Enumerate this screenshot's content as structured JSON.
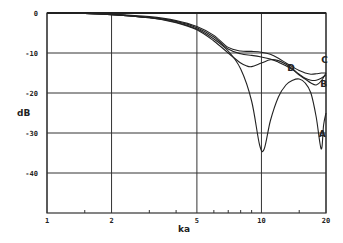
{
  "chart_data": {
    "type": "line",
    "title": "",
    "xlabel": "ka",
    "ylabel": "dB",
    "xscale": "log",
    "xlim": [
      1,
      20
    ],
    "ylim": [
      -50,
      0
    ],
    "grid": true,
    "x_ticks": [
      "1",
      "2",
      "5",
      "10",
      "20"
    ],
    "y_ticks": [
      "0",
      "-10",
      "-20",
      "-30",
      "-40"
    ],
    "series": [
      {
        "name": "A",
        "x": [
          1,
          1.5,
          2,
          3,
          4,
          5,
          6,
          7,
          8,
          9,
          9.8,
          10.3,
          11,
          12,
          13,
          14,
          15,
          16,
          17,
          18,
          19,
          19.5,
          20
        ],
        "values": [
          0,
          -0.1,
          -0.4,
          -1.2,
          -2.3,
          -4,
          -6.5,
          -9.5,
          -14,
          -22,
          -33,
          -34,
          -27,
          -21,
          -18,
          -16.8,
          -16.5,
          -17.5,
          -20,
          -26,
          -34,
          -28,
          -25
        ]
      },
      {
        "name": "B",
        "x": [
          1,
          1.5,
          2,
          3,
          4,
          5,
          6,
          7,
          8,
          9,
          10,
          11,
          12,
          13,
          14,
          15,
          16,
          17,
          18,
          19,
          20
        ],
        "values": [
          0,
          -0.1,
          -0.4,
          -1.1,
          -2.1,
          -3.7,
          -6,
          -9,
          -10.2,
          -10.6,
          -11,
          -11.5,
          -12.3,
          -13.2,
          -14.2,
          -15.5,
          -16.5,
          -17.5,
          -18,
          -17,
          -15
        ]
      },
      {
        "name": "C",
        "x": [
          1,
          1.5,
          2,
          3,
          4,
          5,
          6,
          7,
          8,
          9,
          10,
          11,
          12,
          13,
          14,
          15,
          16,
          17,
          18,
          19,
          20
        ],
        "values": [
          0,
          -0.1,
          -0.3,
          -0.9,
          -1.9,
          -3.4,
          -5.6,
          -8.6,
          -9.5,
          -9.6,
          -9.8,
          -10.3,
          -11.3,
          -12.5,
          -13.5,
          -14.4,
          -15,
          -15.3,
          -15.2,
          -15,
          -15
        ]
      },
      {
        "name": "D",
        "x": [
          1,
          1.5,
          2,
          3,
          4,
          5,
          6,
          7,
          8,
          8.5,
          9,
          10,
          11,
          12,
          13,
          14,
          15,
          16,
          17,
          18,
          19,
          20
        ],
        "values": [
          0,
          -0.1,
          -0.4,
          -1.2,
          -2.4,
          -4.2,
          -7,
          -10,
          -12.5,
          -13.2,
          -13.4,
          -12.5,
          -11.7,
          -11.9,
          -12.8,
          -14,
          -15.3,
          -16.3,
          -16.8,
          -16.8,
          -16.3,
          -15.5
        ]
      }
    ],
    "annotations": [
      {
        "text": "A",
        "x": 18.5,
        "y": -31
      },
      {
        "text": "B",
        "x": 18.8,
        "y": -18.5
      },
      {
        "text": "C",
        "x": 19.0,
        "y": -12.5
      },
      {
        "text": "D",
        "x": 13.2,
        "y": -14.5
      }
    ]
  }
}
